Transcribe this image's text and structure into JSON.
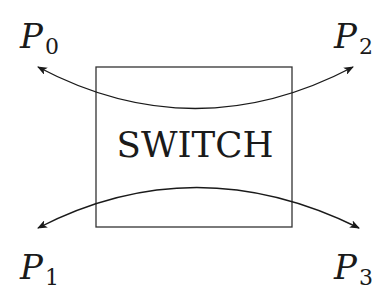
{
  "diagram": {
    "switch": {
      "label": "SWITCH"
    },
    "ports": [
      {
        "id": "P0",
        "main": "P",
        "sub": "0"
      },
      {
        "id": "P1",
        "main": "P",
        "sub": "1"
      },
      {
        "id": "P2",
        "main": "P",
        "sub": "2"
      },
      {
        "id": "P3",
        "main": "P",
        "sub": "3"
      }
    ],
    "connections": [
      {
        "from": "P0",
        "to": "P2",
        "bidirectional": true
      },
      {
        "from": "P1",
        "to": "P3",
        "bidirectional": true
      }
    ],
    "colors": {
      "stroke": "#1a1a1a",
      "background": "#ffffff"
    }
  }
}
